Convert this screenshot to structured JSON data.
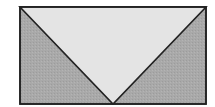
{
  "diagram": {
    "type": "geometric-figure",
    "rectangle": {
      "x": 20,
      "y": 7,
      "width": 186,
      "height": 97,
      "fill": "#a9a9a9",
      "stroke": "#222222"
    },
    "inner_triangle": {
      "points": [
        [
          20,
          7
        ],
        [
          206,
          7
        ],
        [
          113,
          104
        ]
      ],
      "fill": "#e4e4e4",
      "stroke": "#222222"
    },
    "side_regions": [
      {
        "name": "left-shaded-triangle",
        "points": [
          [
            20,
            7
          ],
          [
            113,
            104
          ],
          [
            20,
            104
          ]
        ],
        "fill": "#a9a9a9"
      },
      {
        "name": "right-shaded-triangle",
        "points": [
          [
            206,
            7
          ],
          [
            206,
            104
          ],
          [
            113,
            104
          ]
        ],
        "fill": "#a9a9a9"
      }
    ],
    "colors": {
      "shaded": "#a9a9a9",
      "unshaded": "#e4e4e4",
      "outline": "#222222"
    }
  }
}
